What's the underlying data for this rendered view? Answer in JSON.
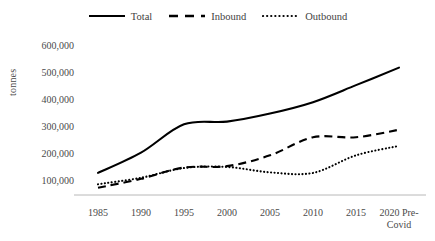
{
  "chart_data": {
    "type": "line",
    "title": "",
    "subtitle": "",
    "xlabel": "",
    "ylabel": "tonnes",
    "grid": false,
    "legend_position": "top-center",
    "categories": [
      "1985",
      "1990",
      "1995",
      "2000",
      "2005",
      "2010",
      "2015",
      "2020 Pre-Covid"
    ],
    "x_tick_labels": [
      "1985",
      "1990",
      "1995",
      "2000",
      "2005",
      "2010",
      "2015",
      "2020 Pre-Covid"
    ],
    "y_tick_labels": [
      "100,000",
      "200,000",
      "300,000",
      "400,000",
      "500,000",
      "600,000"
    ],
    "y_tick_values": [
      100000,
      200000,
      300000,
      400000,
      500000,
      600000
    ],
    "ylim": [
      0,
      600000
    ],
    "series": [
      {
        "name": "Total",
        "style": "solid",
        "color": "#000000",
        "values": [
          130000,
          205000,
          310000,
          320000,
          350000,
          392000,
          455000,
          520000
        ]
      },
      {
        "name": "Inbound",
        "style": "dashed",
        "color": "#000000",
        "values": [
          75000,
          108000,
          150000,
          155000,
          195000,
          262000,
          262000,
          290000
        ]
      },
      {
        "name": "Outbound",
        "style": "dotted",
        "color": "#000000",
        "values": [
          88000,
          112000,
          148000,
          152000,
          132000,
          130000,
          195000,
          230000
        ]
      }
    ]
  },
  "legend": {
    "items": [
      {
        "label": "Total",
        "style": "solid"
      },
      {
        "label": "Inbound",
        "style": "dashed"
      },
      {
        "label": "Outbound",
        "style": "dotted"
      }
    ]
  },
  "axes": {
    "y_title": "tonnes",
    "y_labels": [
      "600,000",
      "500,000",
      "400,000",
      "300,000",
      "200,000",
      "100,000"
    ],
    "x_labels": [
      "1985",
      "1990",
      "1995",
      "2000",
      "2005",
      "2010",
      "2015",
      "2020 Pre-Covid"
    ]
  },
  "colors": {
    "line": "#000000",
    "axis": "#a6a6a6",
    "text": "#4a4a4a",
    "background": "#ffffff"
  }
}
